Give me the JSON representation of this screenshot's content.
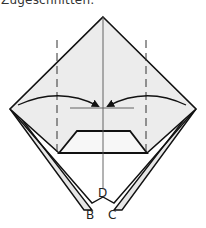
{
  "caption": "Zugeschnitten:",
  "diagram": {
    "type": "origami-fold-step",
    "paper_fill": "#ececec",
    "line_color": "#111111",
    "labels": {
      "b": "B",
      "c": "C",
      "d": "D"
    }
  }
}
